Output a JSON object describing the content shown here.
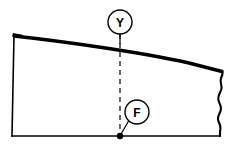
{
  "figure": {
    "type": "technical-line-drawing",
    "background_color": "#ffffff",
    "line_color": "#000000"
  },
  "callouts": [
    {
      "id": "y",
      "label": "Y",
      "name": "callout-y",
      "center_x": 120,
      "center_y": 22,
      "radius": 12,
      "leader": "stem-down-to-top-curve"
    },
    {
      "id": "f",
      "label": "F",
      "name": "callout-f",
      "center_x": 137,
      "center_y": 112,
      "radius": 12,
      "leader": "line-down-left-to-point"
    }
  ],
  "point_marker": {
    "name": "datum-point-f",
    "x": 120,
    "y": 136,
    "radius": 3.2,
    "fill": "#000000"
  },
  "centerline": {
    "name": "vertical-centerline",
    "x": 120,
    "y_top": 34,
    "y_bottom": 136,
    "style": "dashed"
  },
  "outline": {
    "top_left": [
      14,
      35
    ],
    "bottom_left": [
      12,
      136
    ],
    "bottom_right": [
      220,
      136
    ],
    "top_right": [
      222,
      72
    ],
    "top_edge_style": "thick-convex-curve",
    "right_edge_style": "wavy-break-line",
    "left_edge_style": "thin-line",
    "bottom_edge_style": "thin-line"
  }
}
